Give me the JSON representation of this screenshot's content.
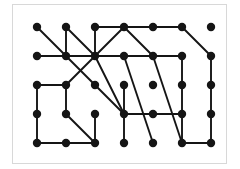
{
  "figure": {
    "kind": "grid-graph-diagram",
    "title": "",
    "background_color": "#ffffff",
    "frame": {
      "visible": true,
      "border_color": "#d8d8d8",
      "fill_color": "#ffffff",
      "x": 12,
      "y": 4,
      "width": 215,
      "height": 160
    }
  },
  "style": {
    "node_color": "#151515",
    "node_radius": 4.2,
    "edge_color": "#151515",
    "edge_width": 1.9
  },
  "grid": {
    "columns": 7,
    "rows": 5,
    "x_positions": [
      37,
      66,
      95,
      124,
      153,
      182,
      211
    ],
    "y_positions": [
      27,
      56,
      85,
      114,
      143
    ]
  },
  "chart_data": {
    "type": "graph",
    "node_count": 35,
    "edge_count": 38,
    "nodes": [
      {
        "id": "r1c1",
        "row": 0,
        "col": 0,
        "x": 37,
        "y": 27
      },
      {
        "id": "r1c2",
        "row": 0,
        "col": 1,
        "x": 66,
        "y": 27
      },
      {
        "id": "r1c3",
        "row": 0,
        "col": 2,
        "x": 95,
        "y": 27
      },
      {
        "id": "r1c4",
        "row": 0,
        "col": 3,
        "x": 124,
        "y": 27
      },
      {
        "id": "r1c5",
        "row": 0,
        "col": 4,
        "x": 153,
        "y": 27
      },
      {
        "id": "r1c6",
        "row": 0,
        "col": 5,
        "x": 182,
        "y": 27
      },
      {
        "id": "r1c7",
        "row": 0,
        "col": 6,
        "x": 211,
        "y": 27
      },
      {
        "id": "r2c1",
        "row": 1,
        "col": 0,
        "x": 37,
        "y": 56
      },
      {
        "id": "r2c2",
        "row": 1,
        "col": 1,
        "x": 66,
        "y": 56
      },
      {
        "id": "r2c3",
        "row": 1,
        "col": 2,
        "x": 95,
        "y": 56
      },
      {
        "id": "r2c4",
        "row": 1,
        "col": 3,
        "x": 124,
        "y": 56
      },
      {
        "id": "r2c5",
        "row": 1,
        "col": 4,
        "x": 153,
        "y": 56
      },
      {
        "id": "r2c6",
        "row": 1,
        "col": 5,
        "x": 182,
        "y": 56
      },
      {
        "id": "r2c7",
        "row": 1,
        "col": 6,
        "x": 211,
        "y": 56
      },
      {
        "id": "r3c1",
        "row": 2,
        "col": 0,
        "x": 37,
        "y": 85
      },
      {
        "id": "r3c2",
        "row": 2,
        "col": 1,
        "x": 66,
        "y": 85
      },
      {
        "id": "r3c3",
        "row": 2,
        "col": 2,
        "x": 95,
        "y": 85
      },
      {
        "id": "r3c4",
        "row": 2,
        "col": 3,
        "x": 124,
        "y": 85
      },
      {
        "id": "r3c5",
        "row": 2,
        "col": 4,
        "x": 153,
        "y": 85
      },
      {
        "id": "r3c6",
        "row": 2,
        "col": 5,
        "x": 182,
        "y": 85
      },
      {
        "id": "r3c7",
        "row": 2,
        "col": 6,
        "x": 211,
        "y": 85
      },
      {
        "id": "r4c1",
        "row": 3,
        "col": 0,
        "x": 37,
        "y": 114
      },
      {
        "id": "r4c2",
        "row": 3,
        "col": 1,
        "x": 66,
        "y": 114
      },
      {
        "id": "r4c3",
        "row": 3,
        "col": 2,
        "x": 95,
        "y": 114
      },
      {
        "id": "r4c4",
        "row": 3,
        "col": 3,
        "x": 124,
        "y": 114
      },
      {
        "id": "r4c5",
        "row": 3,
        "col": 4,
        "x": 153,
        "y": 114
      },
      {
        "id": "r4c6",
        "row": 3,
        "col": 5,
        "x": 182,
        "y": 114
      },
      {
        "id": "r4c7",
        "row": 3,
        "col": 6,
        "x": 211,
        "y": 114
      },
      {
        "id": "r5c1",
        "row": 4,
        "col": 0,
        "x": 37,
        "y": 143
      },
      {
        "id": "r5c2",
        "row": 4,
        "col": 1,
        "x": 66,
        "y": 143
      },
      {
        "id": "r5c3",
        "row": 4,
        "col": 2,
        "x": 95,
        "y": 143
      },
      {
        "id": "r5c4",
        "row": 4,
        "col": 3,
        "x": 124,
        "y": 143
      },
      {
        "id": "r5c5",
        "row": 4,
        "col": 4,
        "x": 153,
        "y": 143
      },
      {
        "id": "r5c6",
        "row": 4,
        "col": 5,
        "x": 182,
        "y": 143
      },
      {
        "id": "r5c7",
        "row": 4,
        "col": 6,
        "x": 211,
        "y": 143
      }
    ],
    "edges": [
      {
        "from": "r1c3",
        "to": "r1c4",
        "kind": "horizontal"
      },
      {
        "from": "r1c4",
        "to": "r1c5",
        "kind": "horizontal"
      },
      {
        "from": "r1c5",
        "to": "r1c6",
        "kind": "horizontal"
      },
      {
        "from": "r2c1",
        "to": "r2c2",
        "kind": "horizontal"
      },
      {
        "from": "r2c2",
        "to": "r2c3",
        "kind": "horizontal"
      },
      {
        "from": "r2c3",
        "to": "r2c4",
        "kind": "horizontal"
      },
      {
        "from": "r2c4",
        "to": "r2c5",
        "kind": "horizontal"
      },
      {
        "from": "r2c5",
        "to": "r2c6",
        "kind": "horizontal"
      },
      {
        "from": "r3c1",
        "to": "r3c2",
        "kind": "horizontal"
      },
      {
        "from": "r4c4",
        "to": "r4c5",
        "kind": "horizontal"
      },
      {
        "from": "r4c5",
        "to": "r4c6",
        "kind": "horizontal"
      },
      {
        "from": "r5c1",
        "to": "r5c2",
        "kind": "horizontal"
      },
      {
        "from": "r5c2",
        "to": "r5c3",
        "kind": "horizontal"
      },
      {
        "from": "r5c6",
        "to": "r5c7",
        "kind": "horizontal"
      },
      {
        "from": "r1c2",
        "to": "r2c2",
        "kind": "vertical"
      },
      {
        "from": "r1c3",
        "to": "r2c3",
        "kind": "vertical"
      },
      {
        "from": "r2c6",
        "to": "r3c6",
        "kind": "vertical"
      },
      {
        "from": "r2c7",
        "to": "r3c7",
        "kind": "vertical"
      },
      {
        "from": "r3c1",
        "to": "r4c1",
        "kind": "vertical"
      },
      {
        "from": "r3c2",
        "to": "r4c2",
        "kind": "vertical"
      },
      {
        "from": "r3c4",
        "to": "r4c4",
        "kind": "vertical"
      },
      {
        "from": "r3c6",
        "to": "r4c6",
        "kind": "vertical"
      },
      {
        "from": "r3c7",
        "to": "r4c7",
        "kind": "vertical"
      },
      {
        "from": "r4c1",
        "to": "r5c1",
        "kind": "vertical"
      },
      {
        "from": "r4c3",
        "to": "r5c3",
        "kind": "vertical"
      },
      {
        "from": "r4c4",
        "to": "r5c4",
        "kind": "vertical"
      },
      {
        "from": "r4c6",
        "to": "r5c6",
        "kind": "vertical"
      },
      {
        "from": "r4c7",
        "to": "r5c7",
        "kind": "vertical"
      },
      {
        "from": "r1c1",
        "to": "r2c2",
        "kind": "diagonal"
      },
      {
        "from": "r1c2",
        "to": "r2c3",
        "kind": "diagonal"
      },
      {
        "from": "r1c4",
        "to": "r2c3",
        "kind": "diagonal"
      },
      {
        "from": "r1c6",
        "to": "r2c7",
        "kind": "diagonal"
      },
      {
        "from": "r2c2",
        "to": "r3c3",
        "kind": "diagonal"
      },
      {
        "from": "r2c3",
        "to": "r4c4",
        "kind": "diagonal-long"
      },
      {
        "from": "r3c2",
        "to": "r2c3",
        "kind": "diagonal"
      },
      {
        "from": "r3c3",
        "to": "r4c4",
        "kind": "diagonal"
      },
      {
        "from": "r4c2",
        "to": "r5c3",
        "kind": "diagonal"
      },
      {
        "from": "r2c4",
        "to": "r5c5",
        "kind": "diagonal-long"
      },
      {
        "from": "r1c4",
        "to": "r2c5",
        "kind": "diagonal"
      },
      {
        "from": "r2c5",
        "to": "r5c6",
        "kind": "diagonal-long"
      }
    ],
    "title": "",
    "xlabel": "",
    "ylabel": "",
    "grid_on": false,
    "legend": []
  }
}
